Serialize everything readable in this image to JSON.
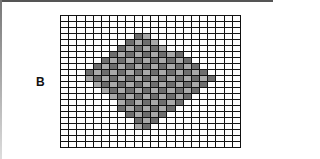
{
  "figure": {
    "panel_label": "B",
    "grid": {
      "columns": 22,
      "rows": 22,
      "empty_color": "#fdfdfd",
      "line_color": "#111111",
      "shade_colors": [
        "#6e6e6e",
        "#8a8a8a",
        "#a9a9a9",
        "#c4c4c4"
      ],
      "shaded_rows": [
        {
          "row": 3,
          "from": 9,
          "to": 10
        },
        {
          "row": 4,
          "from": 8,
          "to": 11
        },
        {
          "row": 5,
          "from": 7,
          "to": 12
        },
        {
          "row": 6,
          "from": 6,
          "to": 14
        },
        {
          "row": 7,
          "from": 5,
          "to": 15
        },
        {
          "row": 8,
          "from": 4,
          "to": 16
        },
        {
          "row": 9,
          "from": 3,
          "to": 17
        },
        {
          "row": 10,
          "from": 3,
          "to": 18
        },
        {
          "row": 11,
          "from": 4,
          "to": 17
        },
        {
          "row": 12,
          "from": 5,
          "to": 16
        },
        {
          "row": 13,
          "from": 6,
          "to": 15
        },
        {
          "row": 14,
          "from": 7,
          "to": 14
        },
        {
          "row": 15,
          "from": 7,
          "to": 13
        },
        {
          "row": 16,
          "from": 8,
          "to": 12
        },
        {
          "row": 17,
          "from": 9,
          "to": 11
        },
        {
          "row": 18,
          "from": 9,
          "to": 10
        }
      ]
    }
  }
}
